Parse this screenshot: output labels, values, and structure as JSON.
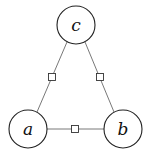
{
  "diagram": {
    "type": "factor-graph",
    "nodes": [
      {
        "id": "a",
        "label": "a",
        "cx": 28,
        "cy": 129,
        "r": 19
      },
      {
        "id": "b",
        "label": "b",
        "cx": 123,
        "cy": 129,
        "r": 19
      },
      {
        "id": "c",
        "label": "c",
        "cx": 76,
        "cy": 25,
        "r": 19
      }
    ],
    "factors": [
      {
        "id": "f_ac",
        "between": [
          "a",
          "c"
        ],
        "cx": 52,
        "cy": 77,
        "size": 7
      },
      {
        "id": "f_bc",
        "between": [
          "b",
          "c"
        ],
        "cx": 100,
        "cy": 77,
        "size": 7
      },
      {
        "id": "f_ab",
        "between": [
          "a",
          "b"
        ],
        "cx": 75,
        "cy": 129,
        "size": 7
      }
    ],
    "colors": {
      "stroke": "#222222",
      "edge": "#555555",
      "background": "#ffffff"
    }
  }
}
